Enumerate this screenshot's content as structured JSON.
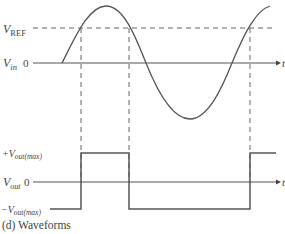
{
  "caption": "(d) Waveforms",
  "top_plot": {
    "vref_label_main": "V",
    "vref_label_sub": "REF",
    "vin_label_main": "V",
    "vin_label_sub": "in",
    "zero_label": "0",
    "t_label": "t"
  },
  "bottom_plot": {
    "pos_max_prefix": "+V",
    "pos_max_sub": "out(max)",
    "vout_label_main": "V",
    "vout_label_sub": "out",
    "zero_label": "0",
    "neg_max_prefix": "−V",
    "neg_max_sub": "out(max)",
    "t_label": "t"
  },
  "colors": {
    "line": "#555555",
    "dash": "#666666",
    "text": "#444444"
  }
}
